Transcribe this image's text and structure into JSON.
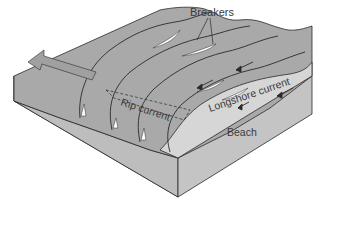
{
  "diagram": {
    "labels": {
      "breakers": "Breakers",
      "longshore_current": "Longshore current",
      "rip_current": "Rip current",
      "beach": "Beach"
    },
    "colors": {
      "water_surface": "#a9a9a9",
      "water_dark": "#9a9a9a",
      "block_front": "#b4b4b4",
      "block_side": "#c2c2c2",
      "beach": "#d6d6d6",
      "outline": "#2a2a2a",
      "foam": "#ffffff",
      "arrow": "#a0a0a0",
      "label_text": "#3a3a3a"
    }
  }
}
